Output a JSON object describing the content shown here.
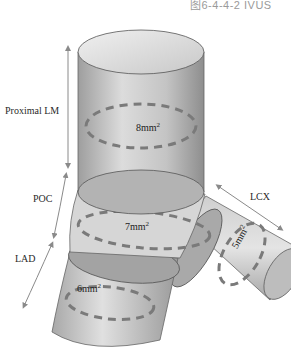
{
  "caption": "图6-4-4-2  IVUS",
  "segments": {
    "proximal_lm": {
      "label": "Proximal LM",
      "area": "8mm",
      "sup": "2"
    },
    "poc": {
      "label": "POC",
      "area": "7mm",
      "sup": "2"
    },
    "lad": {
      "label": "LAD",
      "area": "6mm",
      "sup": "2"
    },
    "lcx": {
      "label": "LCX",
      "area": "5mm",
      "sup": "2"
    }
  },
  "colors": {
    "vessel_fill": "#b8b8b8",
    "vessel_light": "#e6e6e6",
    "vessel_dark": "#8c8c8c",
    "dash": "#7a7a7a",
    "arrow": "#8a8a8a",
    "outline": "#555555"
  }
}
